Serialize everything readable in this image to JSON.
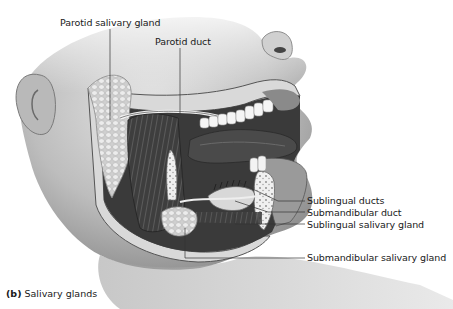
{
  "figure": {
    "caption_letter": "(b)",
    "caption_text": "Salivary glands",
    "colors": {
      "text": "#1a1a1a",
      "leader_line": "#333333",
      "background": "#ffffff"
    }
  },
  "labels": [
    {
      "id": "parotid-salivary-gland",
      "text": "Parotid salivary gland"
    },
    {
      "id": "parotid-duct",
      "text": "Parotid duct"
    },
    {
      "id": "sublingual-ducts",
      "text": "Sublingual ducts"
    },
    {
      "id": "submandibular-duct",
      "text": "Submandibular duct"
    },
    {
      "id": "sublingual-salivary-gland",
      "text": "Sublingual salivary gland"
    },
    {
      "id": "submandibular-salivary-gland",
      "text": "Submandibular salivary gland"
    }
  ]
}
